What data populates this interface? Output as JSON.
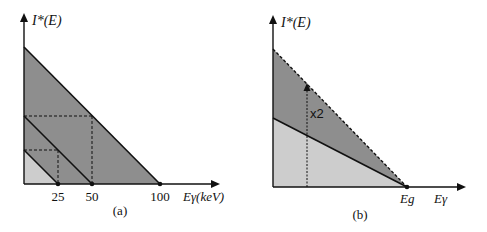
{
  "colors": {
    "dark_fill": "#8e8e8e",
    "light_fill": "#cdcdcd",
    "line": "#111111",
    "background": "#ffffff"
  },
  "panel_a": {
    "y_axis_label": "I*(E)",
    "x_axis_label": "Eγ(keV)",
    "ticks": [
      "25",
      "50",
      "100"
    ],
    "caption": "(a)"
  },
  "panel_b": {
    "y_axis_label": "I*(E)",
    "x_axis_label": "Eγ",
    "gap_label": "Eg",
    "arrow_label": "x2",
    "caption": "(b)"
  }
}
